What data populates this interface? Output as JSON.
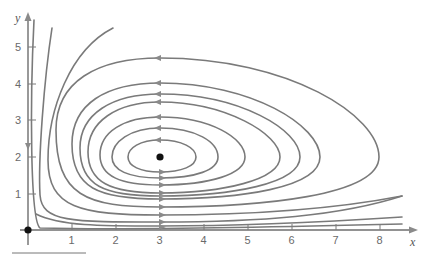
{
  "figure": {
    "type": "phase-portrait",
    "title": "",
    "x_axis": {
      "label": "x",
      "ticks": [
        1,
        2,
        3,
        4,
        5,
        6,
        7,
        8
      ],
      "range": [
        0,
        8.6
      ]
    },
    "y_axis": {
      "label": "y",
      "ticks": [
        1,
        2,
        3,
        4,
        5
      ],
      "range": [
        0,
        5.5
      ]
    },
    "equilibria": [
      {
        "x": 0,
        "y": 0
      },
      {
        "x": 3,
        "y": 2
      }
    ],
    "closed_orbits_crossing_x3": {
      "note": "y-values where closed orbits cross x=3 (top, flowing left / bottom, flowing right)",
      "top": [
        2.45,
        2.75,
        3.1,
        3.45,
        3.7,
        3.9,
        4.6
      ],
      "bottom": [
        1.6,
        1.4,
        1.2,
        1.0,
        0.95,
        0.9,
        0.6
      ]
    },
    "open_trajectories": 5,
    "arrow_direction": {
      "top": "left",
      "bottom": "right",
      "y_axis": "down"
    }
  },
  "labels": {
    "x": "x",
    "y": "y",
    "xticks": [
      "1",
      "2",
      "3",
      "4",
      "5",
      "6",
      "7",
      "8"
    ],
    "yticks": [
      "1",
      "2",
      "3",
      "4",
      "5"
    ]
  },
  "style": {
    "curve_color": "#7a7a7a",
    "axis_color": "#6e6e6e",
    "point_color": "#111111"
  }
}
